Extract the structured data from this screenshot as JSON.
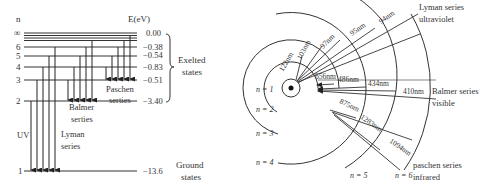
{
  "energy_level_diagram": {
    "n_header": "n",
    "energy_header": "E(eV)",
    "levels": [
      {
        "n": "∞",
        "energy": "0.00"
      },
      {
        "n": "6",
        "energy": "−0.38"
      },
      {
        "n": "5",
        "energy": "−0.54"
      },
      {
        "n": "4",
        "energy": "−0.83"
      },
      {
        "n": "3",
        "energy": "−0.51"
      },
      {
        "n": "2",
        "energy": "−3.40"
      },
      {
        "n": "1",
        "energy": "−13.6"
      }
    ],
    "series_labels": {
      "paschen": [
        "Paschen",
        "serties"
      ],
      "balmer": [
        "Balmer",
        "serties"
      ],
      "lyman": [
        "Lyman",
        "series"
      ],
      "uv": "UV"
    },
    "state_labels": {
      "excited": [
        "Exelted",
        "states"
      ],
      "ground": [
        "Ground",
        "states"
      ]
    }
  },
  "orbit_diagram": {
    "orbits": [
      "n = 1",
      "n = 2",
      "n = 3",
      "n = 4",
      "n = 5",
      "n = 6"
    ],
    "lyman_wavelengths": [
      "122nm",
      "103nm",
      "97nm",
      "95nm",
      "94nm"
    ],
    "balmer_wavelengths": [
      "656nm",
      "486nm",
      "434nm",
      "410nm"
    ],
    "paschen_wavelengths": [
      "875nm",
      "1283nm",
      "1094nm"
    ],
    "series_labels": {
      "lyman": [
        "Lyman series",
        "ultraviolet"
      ],
      "balmer": [
        "Balmer series",
        "visible"
      ],
      "paschen": [
        "paschen series",
        "infrared"
      ]
    }
  }
}
